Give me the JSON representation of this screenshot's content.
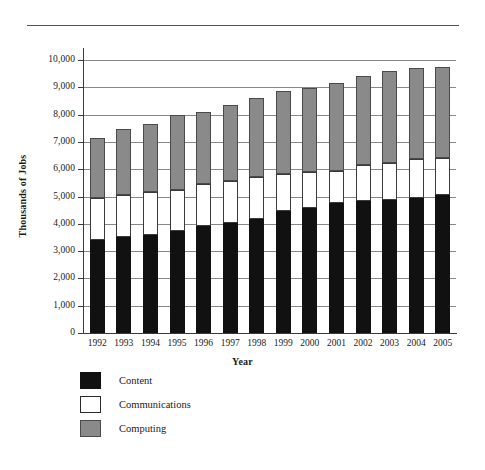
{
  "chart_data": {
    "type": "bar",
    "stacked": true,
    "title": "",
    "xlabel": "Year",
    "ylabel": "Thousands of Jobs",
    "ylim": [
      0,
      10000
    ],
    "ytick_step": 1000,
    "ytick_labels": [
      "10,000",
      "9,000",
      "8,000",
      "7,000",
      "6,000",
      "5,000",
      "4,000",
      "3,000",
      "2,000",
      "1,000",
      "0"
    ],
    "ytick_values": [
      10000,
      9000,
      8000,
      7000,
      6000,
      5000,
      4000,
      3000,
      2000,
      1000,
      0
    ],
    "grid": true,
    "legend_position": "below-left",
    "categories": [
      "1992",
      "1993",
      "1994",
      "1995",
      "1996",
      "1997",
      "1998",
      "1999",
      "2000",
      "2001",
      "2002",
      "2003",
      "2004",
      "2005"
    ],
    "series": [
      {
        "name": "Content",
        "color": "#111111",
        "values": [
          3400,
          3500,
          3580,
          3740,
          3910,
          4030,
          4160,
          4460,
          4590,
          4780,
          4850,
          4870,
          4930,
          5050
        ]
      },
      {
        "name": "Communications",
        "color": "#ffffff",
        "values": [
          1550,
          1570,
          1580,
          1500,
          1540,
          1540,
          1560,
          1380,
          1320,
          1150,
          1320,
          1350,
          1440,
          1350
        ]
      },
      {
        "name": "Computing",
        "color": "#8a8a8a",
        "values": [
          2200,
          2400,
          2490,
          2750,
          2660,
          2780,
          2880,
          3020,
          3050,
          3240,
          3230,
          3370,
          3330,
          3350
        ]
      }
    ],
    "totals": [
      7150,
      7470,
      7650,
      7990,
      8110,
      8350,
      8600,
      8860,
      8960,
      9170,
      9400,
      9590,
      9700,
      9750
    ]
  },
  "legend": {
    "items": [
      {
        "label": "Content",
        "swatch": "content"
      },
      {
        "label": "Communications",
        "swatch": "communications"
      },
      {
        "label": "Computing",
        "swatch": "computing"
      }
    ]
  }
}
